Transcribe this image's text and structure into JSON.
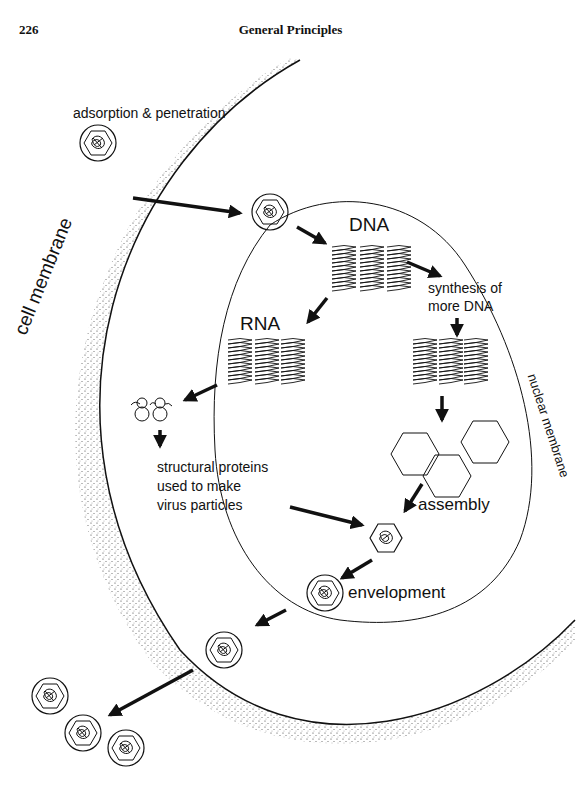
{
  "header": {
    "page_number": "226",
    "running_title": "General Principles"
  },
  "diagram": {
    "type": "virus replication cycle (DNA virus)",
    "regions": {
      "cell_membrane": "cell membrane",
      "nuclear_membrane": "nuclear membrane"
    },
    "labels": {
      "adsorption": "adsorption & penetration",
      "dna": "DNA",
      "synthesis_line1": "synthesis of",
      "synthesis_line2": "more  DNA",
      "rna": "RNA",
      "proteins_line1": "structural proteins",
      "proteins_line2": "used to make",
      "proteins_line3": "virus  particles",
      "assembly": "assembly",
      "envelopment": "envelopment"
    },
    "steps": [
      "adsorption & penetration",
      "DNA",
      "synthesis of more DNA",
      "RNA",
      "structural proteins used to make virus particles",
      "assembly",
      "envelopment",
      "release"
    ],
    "colors": {
      "ink": "#111111",
      "background": "#ffffff"
    }
  }
}
